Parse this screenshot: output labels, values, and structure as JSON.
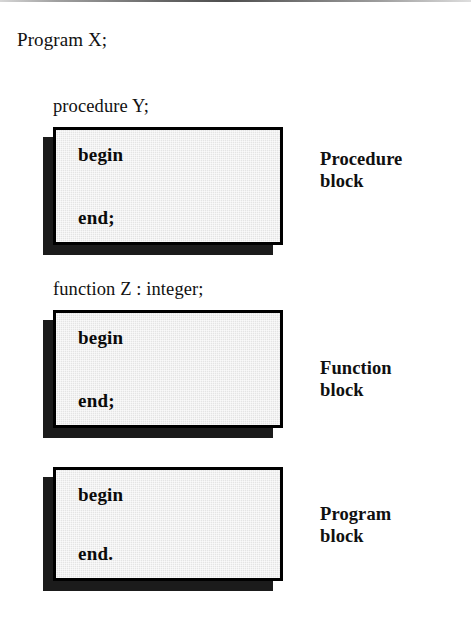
{
  "diagram": {
    "title": "Program X;",
    "colors": {
      "box_fill": "#e4e4e4",
      "box_border": "#000000",
      "shadow": "#1b1b1b",
      "text": "#111111",
      "page_background": "#ffffff"
    },
    "blocks": [
      {
        "declaration": "procedure Y;",
        "begin_keyword": "begin",
        "end_keyword": "end;",
        "caption": "Procedure\nblock"
      },
      {
        "declaration": "function Z : integer;",
        "begin_keyword": "begin",
        "end_keyword": "end;",
        "caption": "Function\nblock"
      },
      {
        "declaration": "",
        "begin_keyword": "begin",
        "end_keyword": "end.",
        "caption": "Program\nblock"
      }
    ]
  }
}
